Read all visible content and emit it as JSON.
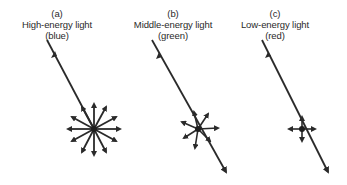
{
  "panels": [
    {
      "tag": "(a)",
      "title": "High-energy light",
      "color_label": "(blue)",
      "scatter": "strong"
    },
    {
      "tag": "(b)",
      "title": "Middle-energy light",
      "color_label": "(green)",
      "scatter": "moderate"
    },
    {
      "tag": "(c)",
      "title": "Low-energy light",
      "color_label": "(red)",
      "scatter": "weak"
    }
  ],
  "colors": {
    "ink": "#2a2a2a",
    "background": "#ffffff"
  }
}
